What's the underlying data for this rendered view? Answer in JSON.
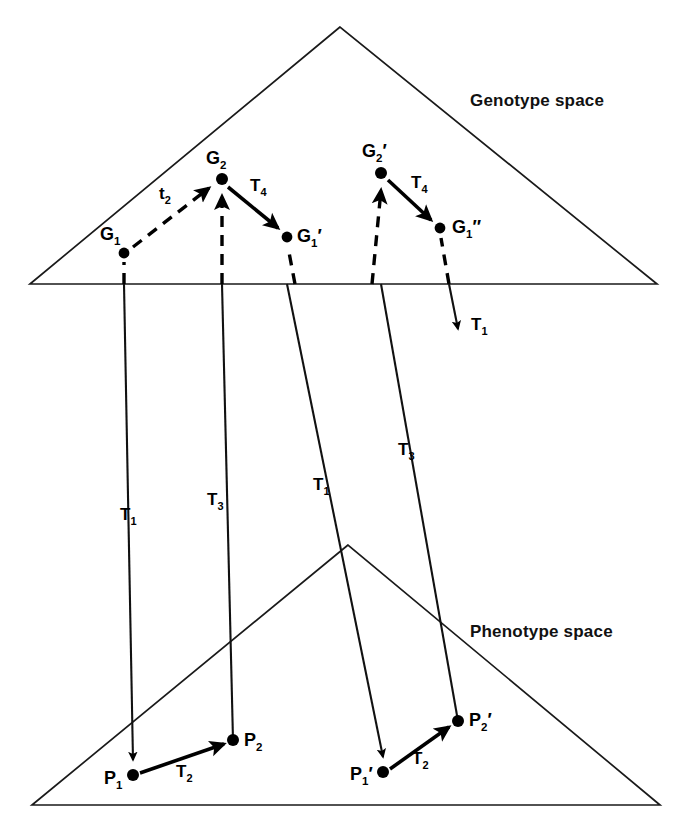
{
  "figure": {
    "title_genotype": "Genotype space",
    "title_phenotype": "Phenotype space",
    "background": "#ffffff",
    "ink": "#000000"
  },
  "spaces": [
    {
      "id": "genotype",
      "label": "Genotype space",
      "label_x": 470,
      "label_y": 106
    },
    {
      "id": "phenotype",
      "label": "Phenotype space",
      "label_x": 470,
      "label_y": 637
    }
  ],
  "nodes": [
    {
      "id": "G1",
      "label": "G",
      "sub": "1",
      "prime": "",
      "x": 124,
      "y": 253,
      "label_x": 100,
      "label_y": 240,
      "space": "genotype"
    },
    {
      "id": "G2",
      "label": "G",
      "sub": "2",
      "prime": "",
      "x": 222,
      "y": 179,
      "label_x": 206,
      "label_y": 164,
      "space": "genotype"
    },
    {
      "id": "G1p",
      "label": "G",
      "sub": "1",
      "prime": "′",
      "x": 287,
      "y": 237,
      "label_x": 297,
      "label_y": 242,
      "space": "genotype"
    },
    {
      "id": "G2p",
      "label": "G",
      "sub": "2",
      "prime": "′",
      "x": 381,
      "y": 173,
      "label_x": 362,
      "label_y": 157,
      "space": "genotype"
    },
    {
      "id": "G1pp",
      "label": "G",
      "sub": "1",
      "prime": "″",
      "x": 440,
      "y": 228,
      "label_x": 452,
      "label_y": 233,
      "space": "genotype"
    },
    {
      "id": "P1",
      "label": "P",
      "sub": "1",
      "prime": "",
      "x": 133,
      "y": 775,
      "label_x": 104,
      "label_y": 784,
      "space": "phenotype"
    },
    {
      "id": "P2",
      "label": "P",
      "sub": "2",
      "prime": "",
      "x": 233,
      "y": 740,
      "label_x": 244,
      "label_y": 746,
      "space": "phenotype"
    },
    {
      "id": "P1p",
      "label": "P",
      "sub": "1",
      "prime": "′",
      "x": 383,
      "y": 772,
      "label_x": 350,
      "label_y": 780,
      "space": "phenotype"
    },
    {
      "id": "P2p",
      "label": "P",
      "sub": "2",
      "prime": "′",
      "x": 458,
      "y": 721,
      "label_x": 469,
      "label_y": 726,
      "space": "phenotype"
    }
  ],
  "edges": [
    {
      "id": "e-t2",
      "label": "t",
      "sub": "2",
      "style": "dashed",
      "from": "G1",
      "to": "G2",
      "label_x": 159,
      "label_y": 199
    },
    {
      "id": "e-T4-left",
      "label": "T",
      "sub": "4",
      "style": "solid",
      "from": "G2",
      "to": "G1p",
      "label_x": 250,
      "label_y": 191
    },
    {
      "id": "e-T4-right",
      "label": "T",
      "sub": "4",
      "style": "solid",
      "from": "G2p",
      "to": "G1pp",
      "label_x": 411,
      "label_y": 188
    },
    {
      "id": "e-T3-left",
      "label": "T",
      "sub": "3",
      "style": "dashed",
      "from": "P2",
      "to": "G2",
      "label_x": 207,
      "label_y": 505
    },
    {
      "id": "e-T3-right",
      "label": "T",
      "sub": "3",
      "style": "dashed",
      "from": "P2p",
      "to": "G2p",
      "label_x": 398,
      "label_y": 455
    },
    {
      "id": "e-T1-left",
      "label": "T",
      "sub": "1",
      "style": "solid",
      "from": "G1",
      "to": "P1",
      "label_x": 120,
      "label_y": 520
    },
    {
      "id": "e-T1-mid",
      "label": "T",
      "sub": "1",
      "style": "solid",
      "from": "G1p",
      "to": "P1p",
      "label_x": 313,
      "label_y": 490
    },
    {
      "id": "e-T1-right",
      "label": "T",
      "sub": "1",
      "style": "dashed",
      "from": "G1pp",
      "to": "arrow-down",
      "label_x": 471,
      "label_y": 330
    },
    {
      "id": "e-T2-left",
      "label": "T",
      "sub": "2",
      "style": "solid",
      "from": "P1",
      "to": "P2",
      "label_x": 176,
      "label_y": 777
    },
    {
      "id": "e-T2-right",
      "label": "T",
      "sub": "2",
      "style": "solid",
      "from": "P1p",
      "to": "P2p",
      "label_x": 412,
      "label_y": 764
    }
  ],
  "geometry": {
    "genotype_triangle": {
      "apex_x": 340,
      "apex_y": 27,
      "left_x": 30,
      "base_y": 284,
      "right_x": 657
    },
    "phenotype_triangle": {
      "apex_x": 348,
      "apex_y": 545,
      "left_x": 32,
      "base_y": 805,
      "right_x": 660
    }
  }
}
